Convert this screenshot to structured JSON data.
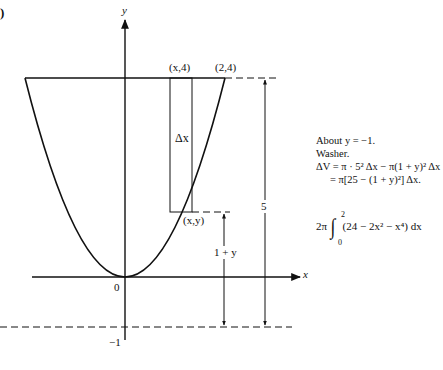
{
  "figure": {
    "panel_marker": ")",
    "axes": {
      "x_label": "x",
      "y_label": "y",
      "origin_label": "0",
      "neg_one_label": "−1"
    },
    "points": {
      "top_left_strip": "(x,4)",
      "top_right": "(2,4)",
      "curve_point": "(x,y)"
    },
    "strip_label": "Δx",
    "dimension_labels": {
      "one_plus_y": "1 + y",
      "five": "5"
    },
    "curve": "y = x^2, 0 to 4 (shown from x=-2 to x=2)"
  },
  "annotation": {
    "line1": "About  y = −1.",
    "line2": "Washer.",
    "line3": "ΔV = π · 5² Δx − π(1 + y)² Δx",
    "line4": "= π[25 − (1 + y)²] Δx.",
    "integral_coef": "2π",
    "integral_upper": "2",
    "integral_lower": "0",
    "integrand": "(24 − 2x² − x⁴) dx"
  }
}
